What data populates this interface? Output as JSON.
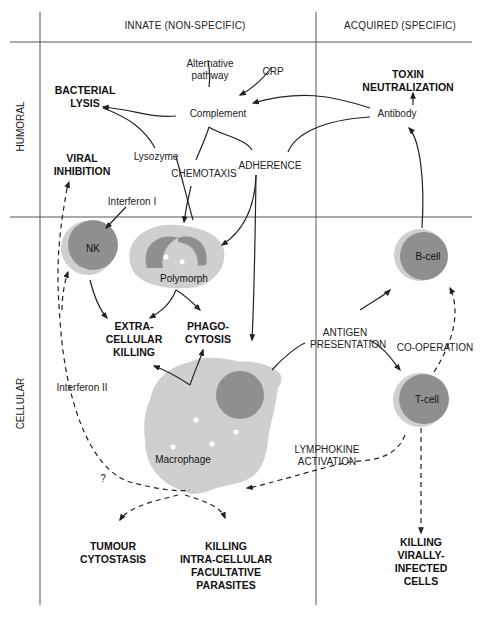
{
  "header": {
    "innate": "INNATE (NON-SPECIFIC)",
    "acquired": "ACQUIRED (SPECIFIC)"
  },
  "rows": {
    "humoral": "HUMORAL",
    "cellular": "CELLULAR"
  },
  "humoral_labels": {
    "alternative_pathway_line1": "Alternative",
    "alternative_pathway_line2": "pathway",
    "crp": "CRP",
    "complement": "Complement",
    "lysozyme": "Lysozyme",
    "chemotaxis": "CHEMOTAXIS",
    "adherence": "ADHERENCE",
    "interferon_1": "Interferon I",
    "antibody": "Antibody"
  },
  "outcomes": {
    "bacterial_lysis_line1": "BACTERIAL",
    "bacterial_lysis_line2": "LYSIS",
    "viral_inhibition_line1": "VIRAL",
    "viral_inhibition_line2": "INHIBITION",
    "toxin_neutralization_line1": "TOXIN",
    "toxin_neutralization_line2": "NEUTRALIZATION",
    "extracellular_killing_line1": "EXTRA-",
    "extracellular_killing_line2": "CELLULAR",
    "extracellular_killing_line3": "KILLING",
    "phagocytosis_line1": "PHAGO-",
    "phagocytosis_line2": "CYTOSIS",
    "tumour_cytostasis_line1": "TUMOUR",
    "tumour_cytostasis_line2": "CYTOSTASIS",
    "killing_intracellular_line1": "KILLING",
    "killing_intracellular_line2": "INTRA-CELLULAR",
    "killing_intracellular_line3": "FACULTATIVE",
    "killing_intracellular_line4": "PARASITES",
    "killing_virally_line1": "KILLING",
    "killing_virally_line2": "VIRALLY-",
    "killing_virally_line3": "INFECTED",
    "killing_virally_line4": "CELLS"
  },
  "cells": {
    "nk": "NK",
    "polymorph": "Polymorph",
    "macrophage": "Macrophage",
    "b_cell": "B-cell",
    "t_cell": "T-cell"
  },
  "cellular_labels": {
    "antigen_presentation_line1": "ANTIGEN",
    "antigen_presentation_line2": "PRESENTATION",
    "co_operation": "CO-OPERATION",
    "interferon_2": "Interferon II",
    "lymphokine_activation_line1": "LYMPHOKINE",
    "lymphokine_activation_line2": "ACTIVATION",
    "question_mark": "?"
  },
  "colors": {
    "cell_light": "#cfcfcf",
    "cell_dark": "#8f8f8f",
    "line": "#222222"
  }
}
